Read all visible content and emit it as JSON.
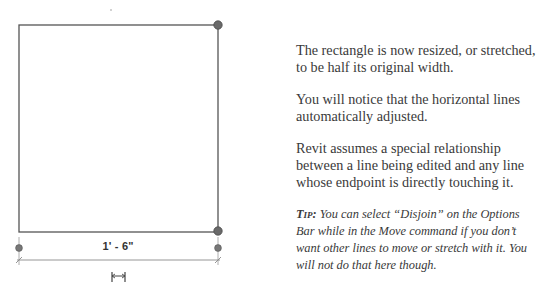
{
  "diagram": {
    "rectangle": {
      "x1": 19,
      "y1": 25,
      "x2": 218,
      "y2": 232,
      "stroke": "#555555"
    },
    "grips": [
      {
        "name": "top-right",
        "x": 218,
        "y": 25
      },
      {
        "name": "bottom-right",
        "x": 218,
        "y": 231
      }
    ],
    "dimension": {
      "label": "1' - 6\"",
      "witness_left": {
        "x": 19,
        "y": 248
      },
      "witness_right": {
        "x": 218,
        "y": 248
      },
      "line_y": 260,
      "flip_icon": "dimension-flip-icon"
    }
  },
  "text": {
    "paragraphs": [
      "The rectangle is now resized, or stretched, to be half its original width.",
      "You will notice that the horizontal lines automatically adjusted.",
      "Revit assumes a special relationship between a line being edited and any line whose endpoint is directly touching it."
    ],
    "tip": {
      "label": "Tip:",
      "body": " You can select “Disjoin” on the Options Bar while in the Move command if you don’t want other lines to move or stretch with it. You will not do that here though."
    }
  },
  "colors": {
    "line": "#555555",
    "grip": "#6a6a6a",
    "text": "#3a3a3a"
  }
}
